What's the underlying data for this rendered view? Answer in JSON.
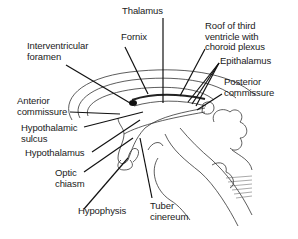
{
  "diagram": {
    "labels": [
      {
        "id": "thalamus",
        "text": "Thalamus",
        "x": 122,
        "y": 11
      },
      {
        "id": "roof-third-ventricle",
        "text": "Roof of third\nventricle with\nchoroid plexus",
        "x": 204,
        "y": 20
      },
      {
        "id": "fornix",
        "text": "Fornix",
        "x": 118,
        "y": 35
      },
      {
        "id": "interventricular-foramen",
        "text": "Interventricular\nforamen",
        "x": 26,
        "y": 43
      },
      {
        "id": "epithalamus",
        "text": "Epithalamus",
        "x": 220,
        "y": 54
      },
      {
        "id": "posterior-commissure",
        "text": "Posterior\ncommissure",
        "x": 224,
        "y": 77
      },
      {
        "id": "anterior-commissure",
        "text": "Anterior\ncommissure",
        "x": 18,
        "y": 96
      },
      {
        "id": "hypothalamic-sulcus",
        "text": "Hypothalamic\nsulcus",
        "x": 21,
        "y": 124
      },
      {
        "id": "hypothalamus",
        "text": "Hypothalamus",
        "x": 25,
        "y": 148
      },
      {
        "id": "optic-chiasm",
        "text": "Optic\nchiasm",
        "x": 55,
        "y": 167
      },
      {
        "id": "hypophysis",
        "text": "Hypophysis",
        "x": 78,
        "y": 206
      },
      {
        "id": "tuber-cinereum",
        "text": "Tuber\ncinereum",
        "x": 150,
        "y": 199
      }
    ]
  }
}
